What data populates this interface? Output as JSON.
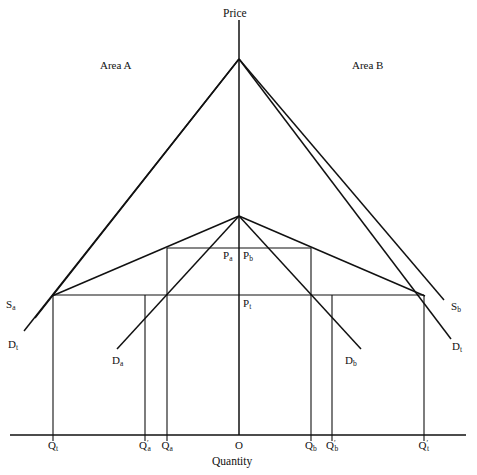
{
  "figure": {
    "type": "economics-supply-demand-diagram",
    "axes": {
      "vertical_label": "Price",
      "horizontal_label": "Quantity",
      "origin_label": "O"
    },
    "regions": [
      {
        "name": "area-a",
        "label": "Area A",
        "x": 100,
        "y": 60
      },
      {
        "name": "area-b",
        "label": "Area B",
        "x": 352,
        "y": 60
      }
    ],
    "price_levels": [
      {
        "name": "price-a",
        "label": "P",
        "sub": "a",
        "x": 223,
        "y": 250
      },
      {
        "name": "price-b",
        "label": "P",
        "sub": "b",
        "x": 243,
        "y": 250
      },
      {
        "name": "price-t",
        "label": "P",
        "sub": "t",
        "x": 243,
        "y": 298
      }
    ],
    "curve_labels": [
      {
        "name": "supply-a",
        "label": "S",
        "sub": "a",
        "prime": "",
        "x": 6,
        "y": 300
      },
      {
        "name": "demand-t-left",
        "label": "D",
        "sub": "t",
        "prime": "",
        "x": 8,
        "y": 340
      },
      {
        "name": "demand-a",
        "label": "D",
        "sub": "a",
        "prime": "",
        "x": 112,
        "y": 355
      },
      {
        "name": "demand-b",
        "label": "D",
        "sub": "b",
        "prime": "",
        "x": 345,
        "y": 355
      },
      {
        "name": "supply-b",
        "label": "S",
        "sub": "b",
        "prime": "",
        "x": 450,
        "y": 302
      },
      {
        "name": "demand-t-right",
        "label": "D",
        "sub": "t",
        "prime": "",
        "x": 452,
        "y": 342
      }
    ],
    "quantity_ticks": [
      {
        "name": "q-t",
        "label": "Q",
        "sub": "t",
        "prime": false,
        "x": 53
      },
      {
        "name": "q-a-prime",
        "label": "Q",
        "sub": "a",
        "prime": true,
        "x": 145
      },
      {
        "name": "q-a",
        "label": "Q",
        "sub": "a",
        "prime": false,
        "x": 167
      },
      {
        "name": "origin",
        "label": "O",
        "sub": "",
        "prime": false,
        "x": 239
      },
      {
        "name": "q-b",
        "label": "Q",
        "sub": "b",
        "prime": false,
        "x": 311
      },
      {
        "name": "q-b-prime",
        "label": "Q",
        "sub": "b",
        "prime": true,
        "x": 332
      },
      {
        "name": "q-t-prime",
        "label": "Q",
        "sub": "t",
        "prime": true,
        "x": 424
      }
    ]
  },
  "chart_data": {
    "type": "line",
    "title": "",
    "xlabel": "Quantity",
    "ylabel": "Price",
    "grid": false,
    "legend": "inline-curve-labels",
    "note": "Two back-to-back markets (Area A left of origin, Area B right of origin) sharing a common vertical price axis. Prices rise upward; quantities increase outward from the origin O in both directions.",
    "axis_pixels": {
      "origin_x": 239,
      "baseline_y": 435,
      "apex_y": 59
    },
    "price_line_levels": [
      {
        "name": "P_a / P_b",
        "y_px": 248,
        "x_from": 167,
        "x_to": 311
      },
      {
        "name": "P_t",
        "y_px": 295,
        "x_from": 53,
        "x_to": 424
      }
    ],
    "series": [
      {
        "name": "S_a",
        "side": "left",
        "points": [
          [
            239,
            59
          ],
          [
            53,
            295
          ],
          [
            35,
            318
          ]
        ]
      },
      {
        "name": "D_t (left)",
        "side": "left",
        "points": [
          [
            239,
            59
          ],
          [
            53,
            295
          ],
          [
            24,
            329
          ]
        ]
      },
      {
        "name": "D_a",
        "side": "left",
        "points": [
          [
            239,
            216
          ],
          [
            167,
            248
          ],
          [
            117,
            348
          ]
        ]
      },
      {
        "name": "S_b",
        "side": "right",
        "points": [
          [
            239,
            59
          ],
          [
            424,
            295
          ],
          [
            443,
            300
          ]
        ]
      },
      {
        "name": "D_t (right)",
        "side": "right",
        "points": [
          [
            239,
            59
          ],
          [
            424,
            295
          ],
          [
            450,
            337
          ]
        ]
      },
      {
        "name": "D_b",
        "side": "right",
        "points": [
          [
            239,
            216
          ],
          [
            311,
            248
          ],
          [
            360,
            348
          ]
        ]
      },
      {
        "name": "inner-peak-left",
        "side": "left",
        "points": [
          [
            239,
            216
          ],
          [
            53,
            295
          ]
        ]
      },
      {
        "name": "inner-peak-right",
        "side": "right",
        "points": [
          [
            239,
            216
          ],
          [
            424,
            295
          ]
        ]
      }
    ],
    "equilibria": [
      {
        "name": "autarky-A",
        "price": "P_a",
        "quantity": "Q_a",
        "x_px": 167,
        "y_px": 248
      },
      {
        "name": "autarky-B",
        "price": "P_b",
        "quantity": "Q_b",
        "x_px": 311,
        "y_px": 248
      },
      {
        "name": "trade-A",
        "price": "P_t",
        "quantity": "Q_t / Q'_a",
        "x_px": 53,
        "y_px": 295
      },
      {
        "name": "trade-B",
        "price": "P_t",
        "quantity": "Q'_t / Q'_b",
        "x_px": 424,
        "y_px": 295
      }
    ]
  }
}
